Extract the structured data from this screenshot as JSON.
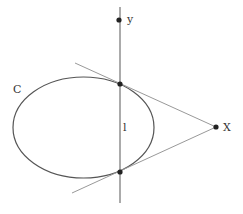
{
  "diagram": {
    "labels": {
      "curve": "C",
      "point_y": "y",
      "point_x": "X",
      "line": "l"
    },
    "colors": {
      "curve": "#555555",
      "line": "#666666",
      "tangent": "#999999",
      "point": "#222222"
    },
    "ellipse": {
      "cx": 83.5,
      "cy": 127.5,
      "rx": 70.5,
      "ry": 50.5
    },
    "vertical_line": {
      "x": 120,
      "y1": 7,
      "y2": 203
    },
    "points": [
      {
        "name": "y",
        "x": 119,
        "y": 20
      },
      {
        "name": "upper-tangent-point",
        "x": 120,
        "y": 84
      },
      {
        "name": "lower-tangent-point",
        "x": 120,
        "y": 172
      },
      {
        "name": "X",
        "x": 216,
        "y": 127
      }
    ],
    "tangents": [
      {
        "x1": 75,
        "y1": 63,
        "x2": 216,
        "y2": 127
      },
      {
        "x1": 72,
        "y1": 193,
        "x2": 216,
        "y2": 127
      }
    ]
  }
}
